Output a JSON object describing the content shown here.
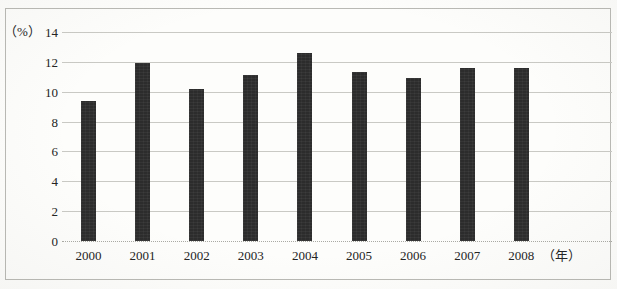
{
  "chart_data": {
    "type": "bar",
    "title": "",
    "subtitle": "",
    "xlabel": "（年）",
    "ylabel": "（%）",
    "categories": [
      "2000",
      "2001",
      "2002",
      "2003",
      "2004",
      "2005",
      "2006",
      "2007",
      "2008"
    ],
    "values": [
      9.4,
      11.9,
      10.2,
      11.1,
      12.6,
      11.3,
      10.9,
      11.6,
      11.6
    ],
    "series": [
      {
        "name": "",
        "values": [
          9.4,
          11.9,
          10.2,
          11.1,
          12.6,
          11.3,
          10.9,
          11.6,
          11.6
        ]
      }
    ],
    "ylim": [
      0,
      14
    ],
    "yticks": [
      0,
      2,
      4,
      6,
      8,
      10,
      12,
      14
    ],
    "ytick_labels": [
      "0",
      "2",
      "4",
      "6",
      "8",
      "10",
      "12",
      "14"
    ],
    "grid": true,
    "grid_axis": "y",
    "legend": false,
    "legend_position": "none",
    "bar_color": "#2c2c2c",
    "grid_color": "#c9c9c4",
    "background_color": "#fdfdfb",
    "border_color": "#b9b9b4",
    "text_color": "#232323"
  }
}
